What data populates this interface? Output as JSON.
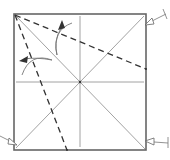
{
  "diagram": {
    "type": "origami-fold-diagram",
    "colors": {
      "background": "#ffffff",
      "paper_edge": "#666666",
      "crease": "#8a8a8a",
      "valley_fold": "#333333",
      "arrow": "#777777"
    },
    "paper": {
      "x": 14,
      "y": 14,
      "width": 132,
      "height": 136
    },
    "center": {
      "x": 80,
      "y": 82
    },
    "existing_creases": [
      {
        "name": "diagonal-tl-br",
        "from": [
          14,
          14
        ],
        "to": [
          146,
          150
        ]
      },
      {
        "name": "diagonal-bl-tr",
        "from": [
          14,
          150
        ],
        "to": [
          146,
          14
        ]
      },
      {
        "name": "vertical-center",
        "from": [
          80,
          16
        ],
        "to": [
          80,
          148
        ]
      },
      {
        "name": "horizontal-center",
        "from": [
          16,
          82
        ],
        "to": [
          144,
          82
        ]
      }
    ],
    "valley_folds": [
      {
        "name": "fold-to-right-edge",
        "from": [
          14,
          14
        ],
        "to": [
          146,
          69
        ]
      },
      {
        "name": "fold-to-bottom-edge",
        "from": [
          14,
          14
        ],
        "to": [
          67,
          150
        ]
      }
    ],
    "fold_arrows": [
      {
        "name": "fold-arrow-upper",
        "direction": "up"
      },
      {
        "name": "fold-arrow-left",
        "direction": "left"
      }
    ],
    "pointer_arrows": [
      {
        "name": "pointer-top-right",
        "target": "top-right-corner"
      },
      {
        "name": "pointer-bottom-left",
        "target": "bottom-left-corner"
      },
      {
        "name": "pointer-bottom-right",
        "target": "bottom-right-corner"
      }
    ]
  }
}
